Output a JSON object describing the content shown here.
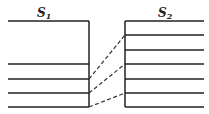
{
  "diagram": {
    "labels": {
      "s1": "S",
      "s1_sub": "1",
      "s2": "S",
      "s2_sub": "2"
    },
    "left_block": {
      "top_y": 21,
      "right_x": 89,
      "left_x": 8,
      "lines_y": [
        64,
        79,
        93,
        107
      ]
    },
    "right_block": {
      "left_x": 125,
      "right_x": 204,
      "lines_y": [
        21,
        35,
        50,
        64,
        79,
        93,
        107
      ]
    },
    "connectors": [
      {
        "from": [
          89,
          79
        ],
        "to": [
          125,
          35
        ],
        "style": "dashed"
      },
      {
        "from": [
          89,
          93
        ],
        "to": [
          125,
          64
        ],
        "style": "dashed"
      },
      {
        "from": [
          89,
          107
        ],
        "to": [
          125,
          93
        ],
        "style": "dashed"
      }
    ],
    "colors": {
      "line": "#222222",
      "background": "#ffffff"
    }
  }
}
